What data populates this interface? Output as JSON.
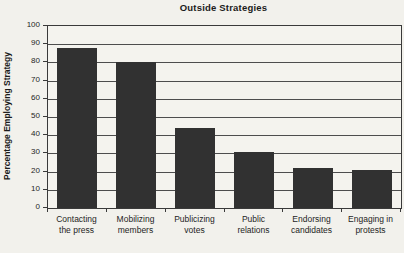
{
  "chart_data": {
    "type": "bar",
    "title": "Outside Strategies",
    "ylabel": "Percentage Employing Strategy",
    "xlabel": "",
    "categories": [
      "Contacting\nthe press",
      "Mobilizing\nmembers",
      "Publicizing\nvotes",
      "Public\nrelations",
      "Endorsing\ncandidates",
      "Engaging in\nprotests"
    ],
    "values": [
      88,
      80,
      44,
      31,
      22,
      21
    ],
    "ylim": [
      0,
      100
    ],
    "yticks": [
      0,
      10,
      20,
      30,
      40,
      50,
      60,
      70,
      80,
      90,
      100
    ],
    "grid": true,
    "legend": false,
    "colors": {
      "bar": "#313131",
      "grid": "#4d4d4d",
      "axis": "#3a3a3a",
      "text": "#1e1e1e",
      "background": "#f2f1ec"
    }
  }
}
